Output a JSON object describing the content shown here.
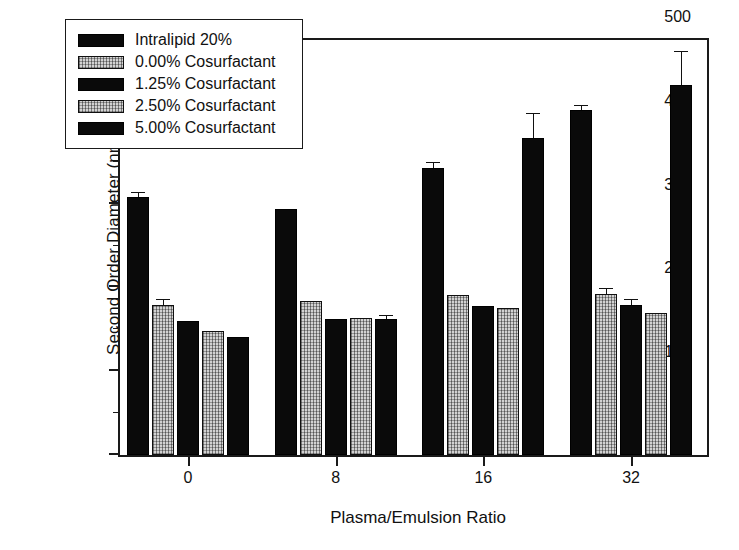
{
  "chart_data": {
    "type": "bar",
    "title": "",
    "xlabel": "Plasma/Emulsion Ratio",
    "ylabel": "Second Order Diameter (nm)",
    "categories": [
      "0",
      "8",
      "16",
      "32"
    ],
    "ylim": [
      0,
      500
    ],
    "yticks": [
      0,
      100,
      200,
      300,
      400,
      500
    ],
    "yticks_minor": [
      50,
      150,
      250,
      350,
      450
    ],
    "grid": false,
    "legend_position": "upper left",
    "series": [
      {
        "name": "Intralipid 20%",
        "fill": "solid",
        "values": [
          308,
          293,
          342,
          412
        ],
        "errors": [
          5,
          0,
          7,
          4
        ]
      },
      {
        "name": "0.00% Cosurfactant",
        "fill": "hatched",
        "values": [
          179,
          184,
          191,
          192
        ],
        "errors": [
          6,
          0,
          0,
          6
        ]
      },
      {
        "name": "1.25% Cosurfactant",
        "fill": "solid",
        "values": [
          160,
          162,
          178,
          179
        ],
        "errors": [
          0,
          0,
          0,
          6
        ]
      },
      {
        "name": "2.50% Cosurfactant",
        "fill": "hatched",
        "values": [
          148,
          163,
          175,
          169
        ],
        "errors": [
          0,
          0,
          0,
          0
        ]
      },
      {
        "name": "5.00% Cosurfactant",
        "fill": "solid",
        "values": [
          141,
          162,
          378,
          441
        ],
        "errors": [
          0,
          4,
          29,
          40
        ]
      }
    ]
  },
  "axis": {
    "y_title": "Second Order Diameter (nm)",
    "x_title": "Plasma/Emulsion Ratio",
    "y_tick_labels": [
      "0",
      "100",
      "200",
      "300",
      "400",
      "500"
    ],
    "x_tick_labels": [
      "0",
      "8",
      "16",
      "32"
    ]
  },
  "legend": {
    "entries": [
      {
        "label": "Intralipid 20%"
      },
      {
        "label": "0.00% Cosurfactant"
      },
      {
        "label": "1.25% Cosurfactant"
      },
      {
        "label": "2.50% Cosurfactant"
      },
      {
        "label": "5.00% Cosurfactant"
      }
    ]
  }
}
